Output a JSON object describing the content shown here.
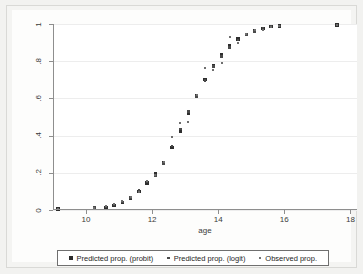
{
  "chart_data": {
    "type": "scatter",
    "title": "",
    "xlabel": "age",
    "ylabel": "",
    "xlim": [
      9.0,
      18.2
    ],
    "ylim": [
      0,
      1
    ],
    "xticks": [
      "10",
      "12",
      "14",
      "16",
      "18"
    ],
    "xtick_values": [
      10,
      12,
      14,
      16,
      18
    ],
    "yticks": [
      "0",
      ".2",
      ".4",
      ".6",
      ".8",
      "1"
    ],
    "ytick_values": [
      0,
      0.2,
      0.4,
      0.6,
      0.8,
      1
    ],
    "grid": "horizontal",
    "legend_position": "below-plot",
    "x": [
      9.15,
      10.25,
      10.6,
      10.85,
      11.1,
      11.35,
      11.6,
      11.85,
      12.1,
      12.35,
      12.6,
      12.85,
      13.1,
      13.35,
      13.6,
      13.85,
      14.1,
      14.35,
      14.6,
      14.85,
      15.1,
      15.35,
      15.6,
      15.85,
      17.6
    ],
    "series": [
      {
        "name": "Predicted prop. (probit)",
        "marker": "square-large",
        "color": "#2e2e2e",
        "values": [
          0.005,
          0.01,
          0.015,
          0.025,
          0.04,
          0.065,
          0.1,
          0.145,
          0.195,
          0.255,
          0.335,
          0.425,
          0.52,
          0.615,
          0.7,
          0.775,
          0.835,
          0.885,
          0.92,
          0.945,
          0.965,
          0.975,
          0.985,
          0.99,
          0.995
        ]
      },
      {
        "name": "Predicted prop. (logit)",
        "marker": "square-medium",
        "color": "#4a4a4a",
        "values": [
          0.005,
          0.012,
          0.018,
          0.028,
          0.042,
          0.068,
          0.105,
          0.15,
          0.185,
          0.25,
          0.345,
          0.435,
          0.53,
          0.61,
          0.695,
          0.77,
          0.825,
          0.875,
          0.915,
          0.945,
          0.96,
          0.975,
          0.985,
          0.99,
          0.995
        ]
      },
      {
        "name": "Observed prop.",
        "marker": "square-small",
        "color": "#6e6e6e",
        "values": [
          0.005,
          0.01,
          0.02,
          0.03,
          0.05,
          0.07,
          0.095,
          0.155,
          0.19,
          0.26,
          0.39,
          0.47,
          0.475,
          0.62,
          0.765,
          0.755,
          0.79,
          0.93,
          0.9,
          0.945,
          0.97,
          0.97,
          0.985,
          0.99,
          0.995
        ]
      }
    ]
  },
  "legend": {
    "items": [
      {
        "label": "Predicted prop. (probit)",
        "marker": "square-large"
      },
      {
        "label": "Predicted prop. (logit)",
        "marker": "square-medium"
      },
      {
        "label": "Observed prop.",
        "marker": "square-small"
      }
    ]
  }
}
